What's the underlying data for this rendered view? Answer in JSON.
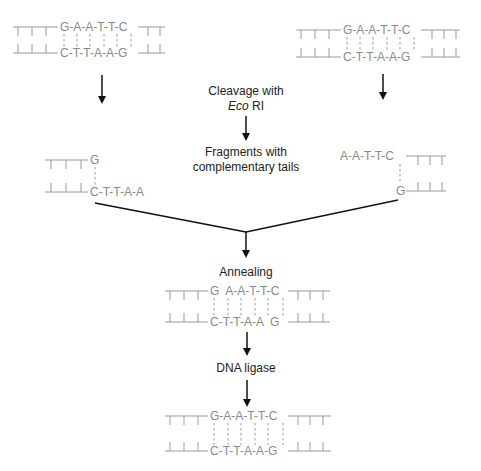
{
  "labels": {
    "cleavage_line1": "Cleavage with",
    "cleavage_italic": "Eco",
    "cleavage_rest": " RI",
    "fragments_line1": "Fragments with",
    "fragments_line2": "complementary tails",
    "annealing": "Annealing",
    "ligase": "DNA ligase"
  },
  "sequences": {
    "recognition_top": [
      "G",
      "A",
      "A",
      "T",
      "T",
      "C"
    ],
    "recognition_bottom": [
      "C",
      "T",
      "T",
      "A",
      "A",
      "G"
    ],
    "left_fragment_top": [
      "G"
    ],
    "left_fragment_bottom": [
      "C",
      "T",
      "T",
      "A",
      "A"
    ],
    "right_fragment_top": [
      "A",
      "A",
      "T",
      "T",
      "C"
    ],
    "right_fragment_bottom": [
      "G"
    ],
    "annealed_top": "G  A-A-T-T-C",
    "annealed_bottom": "C-T-T-A-A  G",
    "ligated_top": "G-A-A-T-T-C",
    "ligated_bottom": "C-T-T-A-A-G"
  },
  "colors": {
    "strand": "#9a9a9a",
    "base_text": "#8a8a8a",
    "arrow": "#111111",
    "label_text": "#222222"
  }
}
